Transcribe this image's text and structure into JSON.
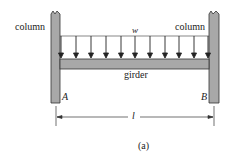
{
  "labels": {
    "column_left": "column",
    "column_right": "column",
    "load": "w",
    "girder": "girder",
    "support_a": "A",
    "support_b": "B",
    "span": "l",
    "caption": "(a)"
  },
  "diagram": {
    "arrow_count": 11,
    "colors": {
      "member_fill": "#a8a8a8",
      "stroke": "#333333"
    }
  }
}
